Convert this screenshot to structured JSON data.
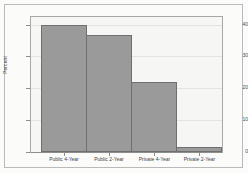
{
  "chart_data": {
    "type": "bar",
    "title": "",
    "xlabel": "",
    "ylabel": "Percent",
    "categories": [
      "Public 4-Year",
      "Public 2-Year",
      "Private 4-Year",
      "Private 2-Year"
    ],
    "values": [
      40,
      37,
      22,
      1.5
    ],
    "ylim": [
      0,
      43
    ],
    "yticks": [
      0,
      10,
      20,
      30,
      40
    ],
    "ytick_labels": [
      "0",
      "10",
      "20",
      "30",
      "40"
    ],
    "grid": true,
    "legend": "none",
    "colors": {
      "bar_fill": "#9a9a9a",
      "bar_edge": "#6f6f6f",
      "plot_background": "#f6f6f4",
      "figure_background": "#fbfbfa",
      "frame": "#a8a8a8",
      "gridline": "#e4e4df",
      "text": "#3f3f3f"
    }
  }
}
